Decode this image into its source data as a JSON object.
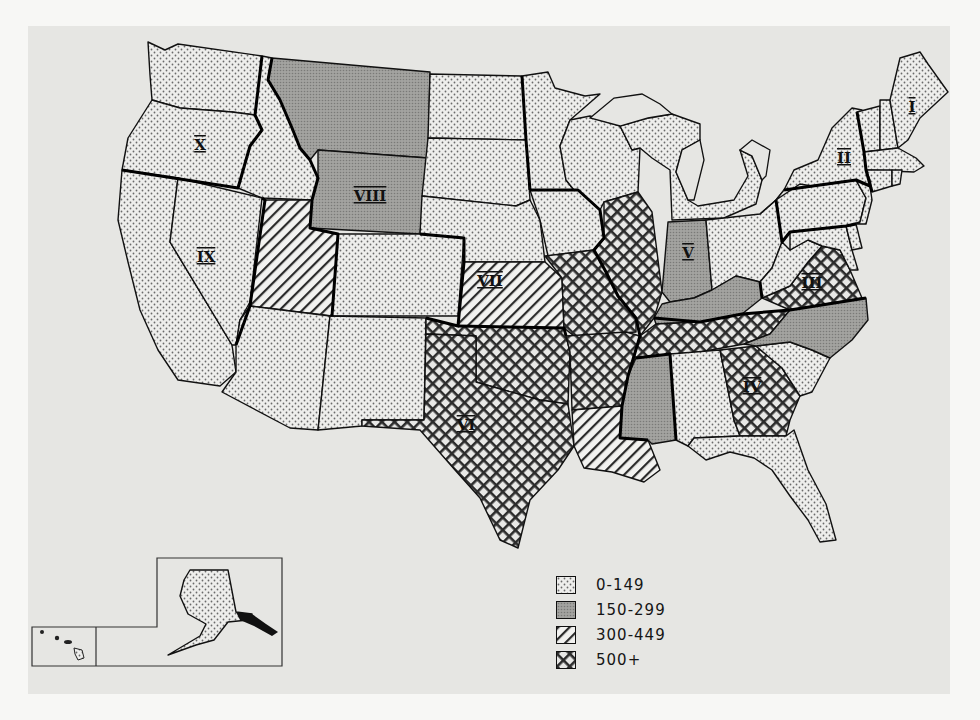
{
  "map": {
    "title": "",
    "subject": "United States by federal region, shaded by value class",
    "legend": [
      {
        "class": "low",
        "label": "0-149",
        "pattern": "dots"
      },
      {
        "class": "mid",
        "label": "150-299",
        "pattern": "fine-gray"
      },
      {
        "class": "high",
        "label": "300-449",
        "pattern": "diagonal"
      },
      {
        "class": "top",
        "label": "500+",
        "pattern": "crosshatch"
      }
    ],
    "regions": [
      {
        "id": "I",
        "label": "I"
      },
      {
        "id": "II",
        "label": "II"
      },
      {
        "id": "III",
        "label": "III"
      },
      {
        "id": "IV",
        "label": "IV"
      },
      {
        "id": "V",
        "label": "V"
      },
      {
        "id": "VI",
        "label": "VI"
      },
      {
        "id": "VII",
        "label": "VII"
      },
      {
        "id": "VIII",
        "label": "VIII"
      },
      {
        "id": "IX",
        "label": "IX"
      },
      {
        "id": "X",
        "label": "X"
      }
    ],
    "states": {
      "WA": "low",
      "OR": "low",
      "ID": "low",
      "CA": "low",
      "NV": "low",
      "MT": "mid",
      "WY": "mid",
      "UT": "high",
      "CO": "low",
      "AZ": "low",
      "NM": "low",
      "ND": "low",
      "SD": "low",
      "NE": "low",
      "KS": "high",
      "MN": "low",
      "IA": "low",
      "MO": "top",
      "WI": "low",
      "IL": "top",
      "MI": "low",
      "IN": "mid",
      "OH": "low",
      "OK": "top",
      "TX": "top",
      "AR": "top",
      "LA": "high",
      "KY": "mid",
      "TN": "top",
      "MS": "mid",
      "AL": "low",
      "GA": "top",
      "FL": "low",
      "SC": "low",
      "NC": "mid",
      "VA": "top",
      "WV": "low",
      "PA": "low",
      "MD": "low",
      "DE": "low",
      "NY": "low",
      "NJ": "low",
      "ME": "low",
      "NH": "low",
      "VT": "low",
      "MA": "low",
      "CT": "low",
      "RI": "low",
      "AK": "low",
      "HI": "low"
    }
  }
}
